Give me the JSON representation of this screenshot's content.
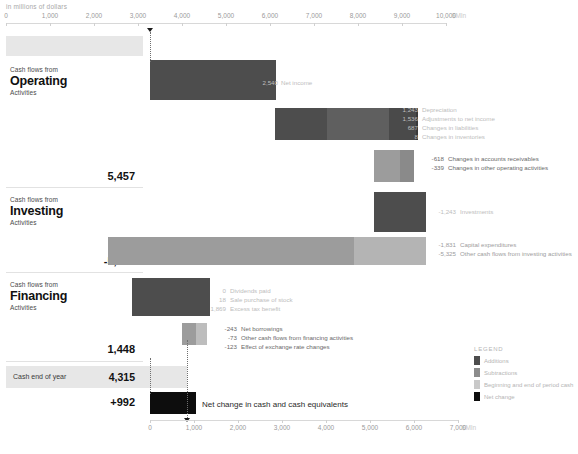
{
  "chart_data": {
    "type": "bar",
    "chart_variant": "waterfall",
    "subtitle": "in millions of dollars",
    "unit_label": "$Mln",
    "top_axis": {
      "ticks": [
        0,
        1000,
        2000,
        3000,
        4000,
        5000,
        6000,
        7000,
        8000,
        9000,
        10000
      ],
      "tick_labels": [
        "0",
        "1,000",
        "2,000",
        "3,000",
        "4,000",
        "5,000",
        "6,000",
        "7,000",
        "8,000",
        "9,000",
        "10,000"
      ],
      "min": 0,
      "max": 10000,
      "unit": "$Mln",
      "grid": false
    },
    "bottom_axis": {
      "ticks": [
        0,
        1000,
        2000,
        3000,
        4000,
        5000,
        6000,
        7000
      ],
      "tick_labels": [
        "0",
        "1,000",
        "2,000",
        "3,000",
        "4,000",
        "5,000",
        "6,000",
        "7,000"
      ],
      "min": 0,
      "max": 7000,
      "unit": "$Mln",
      "grid": false
    },
    "xlabel": "",
    "ylabel": "",
    "sections": [
      {
        "kind": "anchor",
        "label": "Cash beginning of year",
        "value_label": "3,323",
        "value": 3323
      },
      {
        "kind": "group",
        "eyebrow": "Cash flows from",
        "name": "Operating",
        "suffix": "Activities",
        "items": [
          {
            "label": "Net income",
            "value_label": "2,540",
            "value": 2540,
            "sign": "positive"
          },
          {
            "label": "Depreciation",
            "value_label": "1,243",
            "value": 1243,
            "sign": "positive"
          },
          {
            "label": "Adjustments to net income",
            "value_label": "1,536",
            "value": 1536,
            "sign": "positive"
          },
          {
            "label": "Changes in liabilities",
            "value_label": "687",
            "value": 687,
            "sign": "positive"
          },
          {
            "label": "Changes in inventories",
            "value_label": "8",
            "value": 8,
            "sign": "positive"
          },
          {
            "label": "Changes in accounts receivables",
            "value_label": "-618",
            "value": -618,
            "sign": "negative"
          },
          {
            "label": "Changes in other operating activities",
            "value_label": "-339",
            "value": -339,
            "sign": "negative"
          }
        ],
        "subtotal_label": "5,457",
        "subtotal": 5457
      },
      {
        "kind": "group",
        "eyebrow": "Cash flows from",
        "name": "Investing",
        "suffix": "Activities",
        "items": [
          {
            "label": "Investments",
            "value_label": "-1,243",
            "value": -1243,
            "sign": "negative"
          },
          {
            "label": "Capital expenditures",
            "value_label": "-1,831",
            "value": -1831,
            "sign": "negative"
          },
          {
            "label": "Other cash flows from investing activities",
            "value_label": "-5,325",
            "value": -5325,
            "sign": "negative"
          }
        ],
        "subtotal_label": "-5,913",
        "subtotal": -5913
      },
      {
        "kind": "group",
        "eyebrow": "Cash flows from",
        "name": "Financing",
        "suffix": "Activities",
        "items": [
          {
            "label": "Dividends paid",
            "value_label": "0",
            "value": 0,
            "sign": "positive"
          },
          {
            "label": "Sale purchase of stock",
            "value_label": "18",
            "value": 18,
            "sign": "positive"
          },
          {
            "label": "Excess tax benefit",
            "value_label": "1,869",
            "value": 1869,
            "sign": "positive"
          },
          {
            "label": "Net borrowings",
            "value_label": "-243",
            "value": -243,
            "sign": "negative"
          },
          {
            "label": "Other cash flows from financing activities",
            "value_label": "-73",
            "value": -73,
            "sign": "negative"
          },
          {
            "label": "Effect of exchange rate changes",
            "value_label": "-123",
            "value": -123,
            "sign": "negative"
          }
        ],
        "subtotal_label": "1,448",
        "subtotal": 1448
      },
      {
        "kind": "anchor",
        "label": "Cash  end of year",
        "value_label": "4,315",
        "value": 4315
      },
      {
        "kind": "net",
        "value_label": "+992",
        "value": 992,
        "label": "Net change in cash and cash equivalents"
      }
    ],
    "legend": {
      "title": "LEGEND",
      "position": "bottom-right",
      "entries": [
        {
          "label": "Additions",
          "color": "#4d4d4d"
        },
        {
          "label": "Subtractions",
          "color": "#8c8c8c"
        },
        {
          "label": "Beginning and end of period cash",
          "color": "#c9c9c9"
        },
        {
          "label": "Net change",
          "color": "#0d0d0d"
        }
      ]
    },
    "colors": {
      "additions": "#4d4d4d",
      "subtractions": "#8c8c8c",
      "period_cash": "#c9c9c9",
      "net_change": "#0d0d0d",
      "axis": "#d8d8d8",
      "band": "#e7e7e7"
    }
  }
}
